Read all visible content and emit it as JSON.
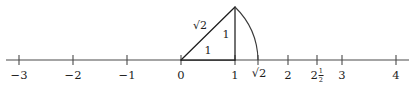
{
  "figure": {
    "colors": {
      "ink": "#1d1d1d",
      "axis": "#4a4a4a",
      "background": "#ffffff"
    },
    "geometry": {
      "axis_y": 60,
      "unit_px": 54,
      "origin_x": 181,
      "axis_start_x": 6,
      "axis_end_x": 409,
      "tick_half_height": 5,
      "triangle": {
        "a_x": 181,
        "a_y": 60,
        "b_x": 235,
        "b_y": 60,
        "c_x": 235,
        "c_y": 7
      },
      "arc": {
        "start_x": 235,
        "start_y": 7,
        "end_x": 258,
        "end_y": 60,
        "radius": 76
      }
    }
  },
  "axis": {
    "name": "real-number-line",
    "ticks": [
      {
        "value": -3,
        "x": 19,
        "label": "−3",
        "type": "integer"
      },
      {
        "value": -2,
        "x": 73,
        "label": "−2",
        "type": "integer"
      },
      {
        "value": -1,
        "x": 127,
        "label": "−1",
        "type": "integer"
      },
      {
        "value": 0,
        "x": 181,
        "label": "0",
        "type": "integer"
      },
      {
        "value": 1,
        "x": 235,
        "label": "1",
        "type": "integer"
      },
      {
        "value": 1.4142,
        "x": 258,
        "label": "√2",
        "type": "radical"
      },
      {
        "value": 2,
        "x": 288,
        "label": "2",
        "type": "integer"
      },
      {
        "value": 2.5,
        "x": 317,
        "label": "2½",
        "type": "mixed",
        "whole": "2",
        "numerator": "1",
        "denominator": "2"
      },
      {
        "value": 3,
        "x": 342,
        "label": "3",
        "type": "integer"
      },
      {
        "value": 4,
        "x": 396,
        "label": "4",
        "type": "integer"
      }
    ]
  },
  "triangle_labels": {
    "hypotenuse": {
      "text": "√2",
      "x": 200,
      "y": 25
    },
    "vertical": {
      "text": "1",
      "x": 226,
      "y": 34
    },
    "horizontal": {
      "text": "1",
      "x": 208,
      "y": 50
    }
  }
}
